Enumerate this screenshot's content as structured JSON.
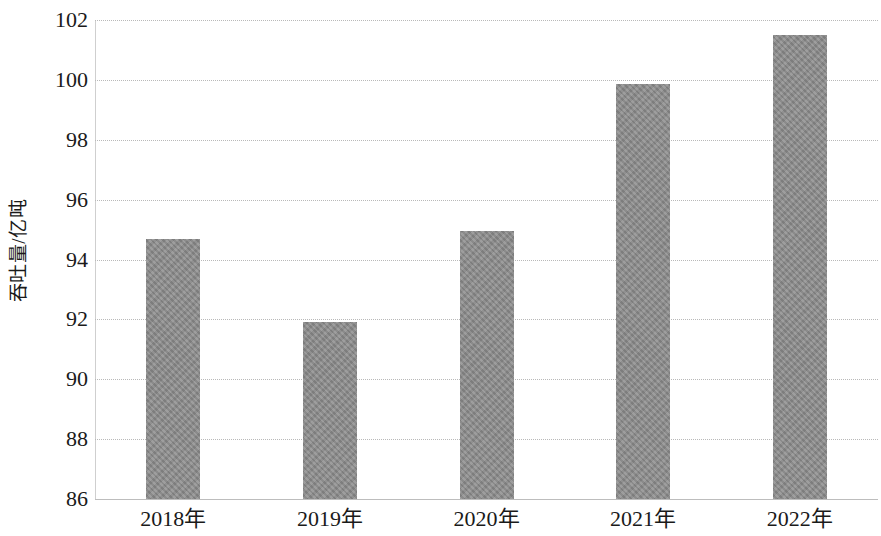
{
  "chart_data": {
    "type": "bar",
    "title": "",
    "subtitle": "",
    "xlabel": "",
    "ylabel": "吞吐量/亿吨",
    "categories": [
      "2018年",
      "2019年",
      "2020年",
      "2021年",
      "2022年"
    ],
    "values": [
      94.7,
      91.9,
      94.95,
      99.85,
      101.5
    ],
    "series": [
      {
        "name": "吞吐量",
        "values": [
          94.7,
          91.9,
          94.95,
          99.85,
          101.5
        ]
      }
    ],
    "ylim": [
      86,
      102
    ],
    "ytick_labels": [
      "86",
      "88",
      "90",
      "92",
      "94",
      "96",
      "98",
      "100",
      "102"
    ],
    "ytick_values": [
      86,
      88,
      90,
      92,
      94,
      96,
      98,
      100,
      102
    ],
    "grid": true,
    "grid_axis": "y",
    "grid_style": "dotted",
    "legend": false,
    "legend_position": "none",
    "bar_color": "#8c8c8c",
    "gridline_color": "#b9b9b9",
    "axis_color": "#bdbdbd",
    "text_color": "#1a1a1a"
  }
}
